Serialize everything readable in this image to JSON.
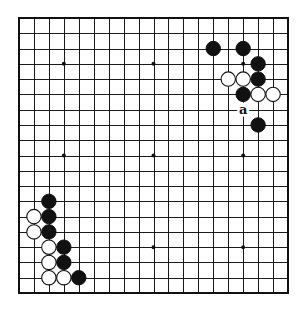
{
  "diagram": {
    "type": "go-board",
    "size": 19,
    "colors": {
      "line": "#1a1a1a",
      "black_stone": "#111111",
      "white_stone": "#ffffff",
      "background": "#ffffff"
    },
    "star_points": [
      [
        3,
        3
      ],
      [
        9,
        3
      ],
      [
        15,
        3
      ],
      [
        3,
        9
      ],
      [
        9,
        9
      ],
      [
        15,
        9
      ],
      [
        3,
        15
      ],
      [
        9,
        15
      ],
      [
        15,
        15
      ]
    ],
    "stones": [
      {
        "color": "black",
        "col": 13,
        "row": 2
      },
      {
        "color": "black",
        "col": 15,
        "row": 2
      },
      {
        "color": "black",
        "col": 16,
        "row": 3
      },
      {
        "color": "white",
        "col": 14,
        "row": 4
      },
      {
        "color": "white",
        "col": 15,
        "row": 4
      },
      {
        "color": "black",
        "col": 16,
        "row": 4
      },
      {
        "color": "black",
        "col": 15,
        "row": 5
      },
      {
        "color": "white",
        "col": 16,
        "row": 5
      },
      {
        "color": "white",
        "col": 17,
        "row": 5
      },
      {
        "color": "black",
        "col": 16,
        "row": 7
      },
      {
        "color": "black",
        "col": 2,
        "row": 12
      },
      {
        "color": "white",
        "col": 1,
        "row": 13
      },
      {
        "color": "black",
        "col": 2,
        "row": 13
      },
      {
        "color": "white",
        "col": 1,
        "row": 14
      },
      {
        "color": "black",
        "col": 2,
        "row": 14
      },
      {
        "color": "white",
        "col": 2,
        "row": 15
      },
      {
        "color": "black",
        "col": 3,
        "row": 15
      },
      {
        "color": "white",
        "col": 2,
        "row": 16
      },
      {
        "color": "black",
        "col": 3,
        "row": 16
      },
      {
        "color": "white",
        "col": 2,
        "row": 17
      },
      {
        "color": "white",
        "col": 3,
        "row": 17
      },
      {
        "color": "black",
        "col": 4,
        "row": 17
      }
    ],
    "labels": [
      {
        "text": "a",
        "col": 15,
        "row": 6
      }
    ]
  }
}
